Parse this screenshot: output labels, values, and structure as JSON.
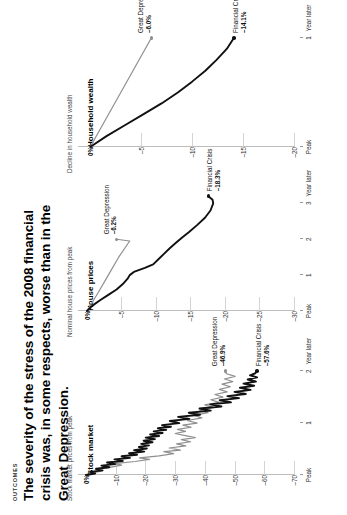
{
  "header": {
    "kicker": "OUTCOMES",
    "headline": "The severity of the stress of the 2008 financial crisis was, in some respects, worse than in the Great Depression."
  },
  "colors": {
    "great_depression": "#8f8f8f",
    "financial_crisis": "#111111",
    "axis": "#bdbdbd",
    "gridline": "#d3d3d3",
    "background": "#ffffff"
  },
  "chart_data": [
    {
      "type": "line",
      "title": "Stock market",
      "ylabel": "Stock market prices from peak",
      "xlabel": "Year later",
      "ytick_labels": [
        "0%",
        "–10",
        "–20",
        "–30",
        "–40",
        "–50",
        "–60",
        "–70"
      ],
      "ytick_values": [
        0,
        -10,
        -20,
        -30,
        -40,
        -50,
        -60,
        -70
      ],
      "ylim": [
        -70,
        2
      ],
      "xtick_labels": [
        "Peak",
        "1",
        "2"
      ],
      "xtick_values": [
        0,
        1,
        2
      ],
      "xlim": [
        0,
        2.35
      ],
      "grid": true,
      "legend": "inline-annotations",
      "series": [
        {
          "name": "Great Depression",
          "color": "#8f8f8f",
          "end_label": "Great Depression",
          "end_value": "–46.9%",
          "points": [
            [
              0.0,
              0
            ],
            [
              0.04,
              -2.2
            ],
            [
              0.08,
              -5.5
            ],
            [
              0.11,
              -3.1
            ],
            [
              0.15,
              -8.4
            ],
            [
              0.19,
              -12.0
            ],
            [
              0.22,
              -9.6
            ],
            [
              0.26,
              -16.5
            ],
            [
              0.3,
              -21.4
            ],
            [
              0.33,
              -18.0
            ],
            [
              0.37,
              -24.6
            ],
            [
              0.41,
              -29.5
            ],
            [
              0.45,
              -26.2
            ],
            [
              0.48,
              -31.8
            ],
            [
              0.52,
              -28.0
            ],
            [
              0.56,
              -33.6
            ],
            [
              0.6,
              -30.5
            ],
            [
              0.64,
              -35.2
            ],
            [
              0.68,
              -32.1
            ],
            [
              0.72,
              -36.8
            ],
            [
              0.76,
              -33.4
            ],
            [
              0.8,
              -30.0
            ],
            [
              0.84,
              -33.5
            ],
            [
              0.88,
              -30.8
            ],
            [
              0.92,
              -35.4
            ],
            [
              0.96,
              -32.6
            ],
            [
              1.0,
              -37.4
            ],
            [
              1.05,
              -34.1
            ],
            [
              1.1,
              -39.0
            ],
            [
              1.15,
              -36.2
            ],
            [
              1.2,
              -41.1
            ],
            [
              1.25,
              -38.3
            ],
            [
              1.3,
              -43.2
            ],
            [
              1.35,
              -40.0
            ],
            [
              1.4,
              -44.8
            ],
            [
              1.45,
              -42.0
            ],
            [
              1.5,
              -46.1
            ],
            [
              1.55,
              -43.4
            ],
            [
              1.6,
              -47.5
            ],
            [
              1.65,
              -44.9
            ],
            [
              1.7,
              -48.6
            ],
            [
              1.75,
              -45.8
            ],
            [
              1.8,
              -49.4
            ],
            [
              1.85,
              -46.6
            ],
            [
              1.9,
              -50.2
            ],
            [
              1.95,
              -47.3
            ],
            [
              2.0,
              -46.9
            ]
          ]
        },
        {
          "name": "Financial Crisis",
          "color": "#111111",
          "end_label": "Financial Crisis",
          "end_value": "–57.6%",
          "points": [
            [
              0.0,
              0
            ],
            [
              0.03,
              -3.1
            ],
            [
              0.06,
              -1.4
            ],
            [
              0.09,
              -5.6
            ],
            [
              0.12,
              -3.4
            ],
            [
              0.15,
              -7.9
            ],
            [
              0.18,
              -5.2
            ],
            [
              0.21,
              -9.8
            ],
            [
              0.24,
              -7.1
            ],
            [
              0.27,
              -12.4
            ],
            [
              0.3,
              -9.6
            ],
            [
              0.33,
              -14.8
            ],
            [
              0.36,
              -12.0
            ],
            [
              0.39,
              -17.2
            ],
            [
              0.42,
              -14.5
            ],
            [
              0.45,
              -19.6
            ],
            [
              0.48,
              -16.2
            ],
            [
              0.51,
              -20.5
            ],
            [
              0.54,
              -17.8
            ],
            [
              0.57,
              -21.2
            ],
            [
              0.6,
              -18.6
            ],
            [
              0.63,
              -22.4
            ],
            [
              0.66,
              -19.4
            ],
            [
              0.69,
              -23.2
            ],
            [
              0.72,
              -20.1
            ],
            [
              0.75,
              -24.6
            ],
            [
              0.78,
              -21.6
            ],
            [
              0.81,
              -25.8
            ],
            [
              0.84,
              -22.8
            ],
            [
              0.87,
              -27.0
            ],
            [
              0.9,
              -24.2
            ],
            [
              0.93,
              -28.6
            ],
            [
              0.96,
              -25.6
            ],
            [
              1.0,
              -31.4
            ],
            [
              1.04,
              -28.2
            ],
            [
              1.08,
              -34.8
            ],
            [
              1.12,
              -31.0
            ],
            [
              1.16,
              -38.4
            ],
            [
              1.2,
              -34.6
            ],
            [
              1.24,
              -42.0
            ],
            [
              1.28,
              -38.2
            ],
            [
              1.32,
              -45.6
            ],
            [
              1.36,
              -41.8
            ],
            [
              1.4,
              -48.8
            ],
            [
              1.44,
              -45.0
            ],
            [
              1.48,
              -51.5
            ],
            [
              1.52,
              -47.6
            ],
            [
              1.56,
              -53.8
            ],
            [
              1.6,
              -50.0
            ],
            [
              1.64,
              -55.4
            ],
            [
              1.68,
              -51.8
            ],
            [
              1.72,
              -56.6
            ],
            [
              1.76,
              -53.0
            ],
            [
              1.8,
              -57.2
            ],
            [
              1.84,
              -54.4
            ],
            [
              1.88,
              -57.6
            ],
            [
              1.92,
              -55.2
            ],
            [
              1.96,
              -57.0
            ],
            [
              2.0,
              -57.6
            ]
          ]
        }
      ]
    },
    {
      "type": "line",
      "title": "House prices",
      "ylabel": "Nominal house prices from peak",
      "xlabel": "Year later",
      "ytick_labels": [
        "0%",
        "–5",
        "–10",
        "–15",
        "–20",
        "–25",
        "–30"
      ],
      "ytick_values": [
        0,
        -5,
        -10,
        -15,
        -20,
        -25,
        -30
      ],
      "ylim": [
        -30,
        1
      ],
      "xtick_labels": [
        "Peak",
        "1",
        "2",
        "3"
      ],
      "xtick_values": [
        0,
        1,
        2,
        3
      ],
      "xlim": [
        0,
        3.4
      ],
      "grid": true,
      "legend": "inline-annotations",
      "series": [
        {
          "name": "Great Depression",
          "color": "#8f8f8f",
          "end_label": "Great Depression",
          "end_value": "–6.2%",
          "points": [
            [
              0.0,
              0
            ],
            [
              0.5,
              -1.6
            ],
            [
              1.0,
              -3.1
            ],
            [
              1.5,
              -4.6
            ],
            [
              1.95,
              -6.2
            ],
            [
              2.0,
              -4.3
            ]
          ]
        },
        {
          "name": "Financial Crisis",
          "color": "#111111",
          "end_label": "Financial Crisis",
          "end_value": "–18.3%",
          "points": [
            [
              0.0,
              0
            ],
            [
              0.15,
              -0.8
            ],
            [
              0.3,
              -1.9
            ],
            [
              0.45,
              -3.1
            ],
            [
              0.6,
              -4.3
            ],
            [
              0.75,
              -5.2
            ],
            [
              0.9,
              -5.9
            ],
            [
              1.0,
              -6.2
            ],
            [
              1.1,
              -6.9
            ],
            [
              1.2,
              -8.4
            ],
            [
              1.3,
              -9.6
            ],
            [
              1.45,
              -10.4
            ],
            [
              1.6,
              -11.2
            ],
            [
              1.75,
              -12.0
            ],
            [
              1.9,
              -12.9
            ],
            [
              2.05,
              -13.8
            ],
            [
              2.2,
              -14.8
            ],
            [
              2.4,
              -16.0
            ],
            [
              2.6,
              -17.1
            ],
            [
              2.8,
              -17.9
            ],
            [
              3.0,
              -18.3
            ],
            [
              3.1,
              -18.2
            ],
            [
              3.2,
              -17.6
            ]
          ]
        }
      ]
    },
    {
      "type": "line",
      "title": "Household wealth",
      "ylabel": "Decline in household wealth",
      "xlabel": "Year later",
      "ytick_labels": [
        "0%",
        "–5",
        "–10",
        "–15",
        "–20"
      ],
      "ytick_values": [
        0,
        -5,
        -10,
        -15,
        -20
      ],
      "ylim": [
        -20,
        1
      ],
      "xtick_labels": [
        "Peak",
        "1"
      ],
      "xtick_values": [
        0,
        1
      ],
      "xlim": [
        0,
        1.12
      ],
      "grid": true,
      "legend": "inline-annotations",
      "series": [
        {
          "name": "Great Depression",
          "color": "#8f8f8f",
          "end_label": "Great Depression",
          "end_value": "–6.0%",
          "points": [
            [
              0.0,
              0
            ],
            [
              1.0,
              -6.0
            ]
          ]
        },
        {
          "name": "Financial Crisis",
          "color": "#111111",
          "end_label": "Financial Crisis",
          "end_value": "–14.1%",
          "points": [
            [
              0.0,
              0
            ],
            [
              0.1,
              -1.6
            ],
            [
              0.2,
              -3.4
            ],
            [
              0.3,
              -5.2
            ],
            [
              0.4,
              -7.0
            ],
            [
              0.5,
              -8.6
            ],
            [
              0.6,
              -10.0
            ],
            [
              0.7,
              -11.3
            ],
            [
              0.8,
              -12.4
            ],
            [
              0.9,
              -13.4
            ],
            [
              1.0,
              -14.1
            ]
          ]
        }
      ]
    }
  ]
}
